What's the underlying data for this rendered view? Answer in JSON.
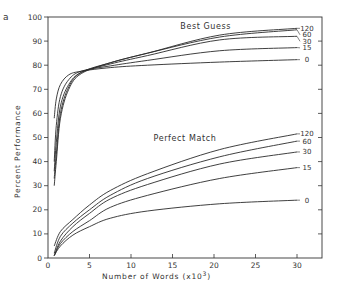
{
  "chart_data": {
    "type": "line",
    "panel_label": "a",
    "title": "",
    "xlabel": "Number of Words  (x10³)",
    "ylabel": "Percent Performance",
    "xlim": [
      0,
      33
    ],
    "ylim": [
      0,
      100
    ],
    "x_ticks": [
      0,
      5,
      10,
      15,
      20,
      25,
      30
    ],
    "y_ticks": [
      0,
      10,
      20,
      30,
      40,
      50,
      60,
      70,
      80,
      90,
      100
    ],
    "grid": false,
    "groups": [
      {
        "name": "Best Guess",
        "label_pos": [
          19,
          95
        ],
        "series": [
          {
            "name": "120",
            "x": [
              0.75,
              1.0,
              1.5,
              2.5,
              4,
              7.5,
              12,
              20.7,
              30
            ],
            "y": [
              30,
              40,
              58,
              70,
              76.5,
              81,
              85,
              92.5,
              95.3
            ]
          },
          {
            "name": "60",
            "x": [
              0.75,
              1.0,
              1.5,
              2.5,
              4,
              7.5,
              12,
              20.7,
              30
            ],
            "y": [
              33,
              43,
              60,
              71,
              77,
              81,
              85,
              91.7,
              94.7
            ]
          },
          {
            "name": "30",
            "x": [
              0.75,
              1.0,
              1.5,
              2.5,
              4,
              7.5,
              12,
              20.7,
              30
            ],
            "y": [
              36,
              48,
              63,
              72,
              77,
              80.5,
              84,
              90.5,
              92
            ]
          },
          {
            "name": "15",
            "x": [
              0.75,
              1.0,
              1.5,
              2.5,
              4,
              7.5,
              12,
              20.7,
              30
            ],
            "y": [
              40,
              55,
              67,
              74,
              77.5,
              79.7,
              82,
              86,
              87.3
            ]
          },
          {
            "name": "0",
            "x": [
              0.75,
              1.0,
              1.5,
              2.5,
              4,
              7.5,
              12,
              20.7,
              30
            ],
            "y": [
              58,
              66,
              72,
              76,
              77.5,
              79,
              80,
              81.3,
              82.3
            ]
          }
        ]
      },
      {
        "name": "Perfect Match",
        "label_pos": [
          16.5,
          48.5
        ],
        "series": [
          {
            "name": "120",
            "x": [
              0.75,
              1.5,
              3,
              5,
              7.5,
              12,
              20.7,
              30
            ],
            "y": [
              5,
              11,
              16,
              22,
              28,
              35,
              45,
              51.5
            ]
          },
          {
            "name": "60",
            "x": [
              0.75,
              1.5,
              3,
              5,
              7.5,
              12,
              20.7,
              30
            ],
            "y": [
              2,
              9,
              14.5,
              20,
              26,
              33,
              42,
              48.5
            ]
          },
          {
            "name": "30",
            "x": [
              0.75,
              1.5,
              3,
              5,
              7.5,
              12,
              20.7,
              30
            ],
            "y": [
              1,
              7,
              13,
              18.5,
              24.5,
              30.5,
              39,
              44
            ]
          },
          {
            "name": "15",
            "x": [
              0.75,
              1.5,
              3,
              5,
              7.5,
              12,
              20.7,
              30
            ],
            "y": [
              1,
              6,
              11,
              15.5,
              21,
              26,
              33,
              37.5
            ]
          },
          {
            "name": "0",
            "x": [
              0.75,
              1.5,
              3,
              5,
              7.5,
              12,
              20.7,
              30
            ],
            "y": [
              1,
              5,
              9.5,
              13,
              16.5,
              19.5,
              22.5,
              24
            ]
          }
        ]
      }
    ]
  },
  "labels": {
    "panel": "a",
    "xlabel": "Number of Words  (x10",
    "xlabel_exp": "3",
    "xlabel_close": ")",
    "ylabel": "Percent Performance"
  }
}
